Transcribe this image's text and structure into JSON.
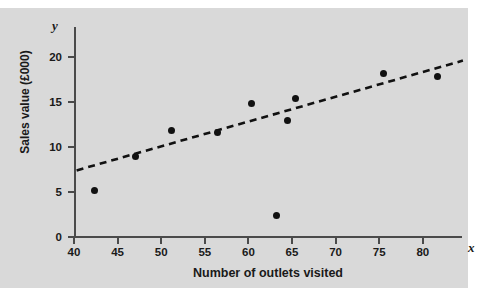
{
  "chart_data": {
    "type": "scatter",
    "title": "",
    "xlabel": "Number of outlets visited",
    "ylabel": "Sales value (£000)",
    "x_axis_symbol": "x",
    "y_axis_symbol": "y",
    "xlim": [
      40,
      82.5
    ],
    "ylim": [
      0,
      23.3
    ],
    "xticks": [
      40,
      45,
      50,
      55,
      60,
      65,
      70,
      75,
      80
    ],
    "yticks": [
      0,
      5,
      10,
      15,
      20
    ],
    "xtick_labels": [
      "40",
      "45",
      "50",
      "55",
      "60",
      "65",
      "70",
      "75",
      "80"
    ],
    "ytick_labels": [
      "0",
      "5",
      "10",
      "15",
      "20"
    ],
    "grid": false,
    "legend": "none",
    "marker_color": "#111111",
    "background_color": "#d9d9d9",
    "axis_color": "#4a4a4a",
    "points": [
      {
        "x": 42.3,
        "y": 5.2
      },
      {
        "x": 47.1,
        "y": 9.0
      },
      {
        "x": 51.2,
        "y": 11.8
      },
      {
        "x": 56.4,
        "y": 11.6
      },
      {
        "x": 60.3,
        "y": 14.8
      },
      {
        "x": 63.2,
        "y": 2.4
      },
      {
        "x": 64.5,
        "y": 13.0
      },
      {
        "x": 65.4,
        "y": 15.4
      },
      {
        "x": 75.5,
        "y": 18.2
      },
      {
        "x": 81.7,
        "y": 17.8
      }
    ],
    "trendline": {
      "style": "dashed",
      "color": "#111111",
      "x_start": 40.3,
      "y_start": 7.4,
      "x_end": 84.6,
      "y_end": 19.6
    }
  }
}
